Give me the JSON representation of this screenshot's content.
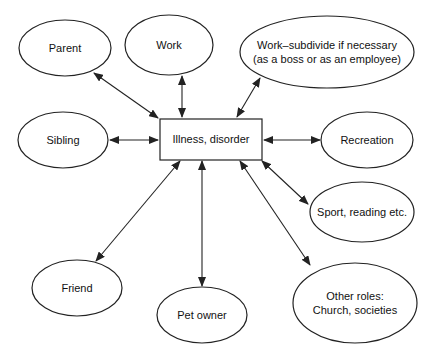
{
  "diagram": {
    "center": {
      "label": "Illness, disorder",
      "x": 160,
      "y": 119,
      "w": 102,
      "h": 41
    },
    "nodes": [
      {
        "id": "parent",
        "label": [
          "Parent"
        ],
        "cx": 65,
        "cy": 48,
        "rx": 46,
        "ry": 28
      },
      {
        "id": "work",
        "label": [
          "Work"
        ],
        "cx": 169,
        "cy": 45,
        "rx": 44,
        "ry": 30
      },
      {
        "id": "work-subdivide",
        "label": [
          "Work–subdivide if necessary",
          "(as a boss or as an employee)"
        ],
        "cx": 327,
        "cy": 52,
        "rx": 87,
        "ry": 36
      },
      {
        "id": "sibling",
        "label": [
          "Sibling"
        ],
        "cx": 63,
        "cy": 140,
        "rx": 45,
        "ry": 28
      },
      {
        "id": "recreation",
        "label": [
          "Recreation"
        ],
        "cx": 367,
        "cy": 140,
        "rx": 46,
        "ry": 28
      },
      {
        "id": "sport",
        "label": [
          "Sport, reading etc."
        ],
        "cx": 362,
        "cy": 212,
        "rx": 52,
        "ry": 30
      },
      {
        "id": "friend",
        "label": [
          "Friend"
        ],
        "cx": 77,
        "cy": 288,
        "rx": 45,
        "ry": 28
      },
      {
        "id": "pet-owner",
        "label": [
          "Pet owner"
        ],
        "cx": 202,
        "cy": 315,
        "rx": 45,
        "ry": 28
      },
      {
        "id": "other-roles",
        "label": [
          "Other roles:",
          "Church, societies"
        ],
        "cx": 355,
        "cy": 303,
        "rx": 62,
        "ry": 40
      }
    ],
    "edges": [
      {
        "from": "parent",
        "x1": 94,
        "y1": 73,
        "x2": 158,
        "y2": 118
      },
      {
        "from": "work",
        "x1": 182,
        "y1": 76,
        "x2": 182,
        "y2": 117
      },
      {
        "from": "work-subdivide",
        "x1": 260,
        "y1": 78,
        "x2": 237,
        "y2": 117
      },
      {
        "from": "sibling",
        "x1": 110,
        "y1": 140,
        "x2": 158,
        "y2": 140
      },
      {
        "from": "recreation",
        "x1": 264,
        "y1": 140,
        "x2": 320,
        "y2": 140
      },
      {
        "from": "sport",
        "x1": 262,
        "y1": 161,
        "x2": 308,
        "y2": 204
      },
      {
        "from": "friend",
        "x1": 180,
        "y1": 161,
        "x2": 96,
        "y2": 261
      },
      {
        "from": "pet-owner",
        "x1": 202,
        "y1": 161,
        "x2": 202,
        "y2": 286
      },
      {
        "from": "other-roles",
        "x1": 240,
        "y1": 161,
        "x2": 310,
        "y2": 265
      }
    ]
  }
}
